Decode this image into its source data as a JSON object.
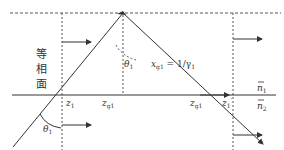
{
  "diagram": {
    "side_label_chars": [
      "等",
      "相",
      "面"
    ],
    "labels": {
      "theta_top": "θ",
      "theta_top_sub": "1",
      "theta_bottom": "θ",
      "theta_bottom_sub": "1",
      "x_g1": "x",
      "x_g1_sub": "g1",
      "x_g1_eq": " = 1/γ",
      "x_g1_eq_sub": "1",
      "z1": "z",
      "z1_sub": "1",
      "zg1_left": "z",
      "zg1_left_sub": "g1",
      "zg1_right": "z",
      "zg1_right_sub": "g1",
      "z1_prime": "z",
      "z1_prime_sub": "1",
      "z1_prime_mark": "′",
      "n1": "n",
      "n1_sub": "1",
      "n2": "n",
      "n2_sub": "2"
    },
    "colors": {
      "line": "#333333",
      "dash": "#555555"
    }
  }
}
